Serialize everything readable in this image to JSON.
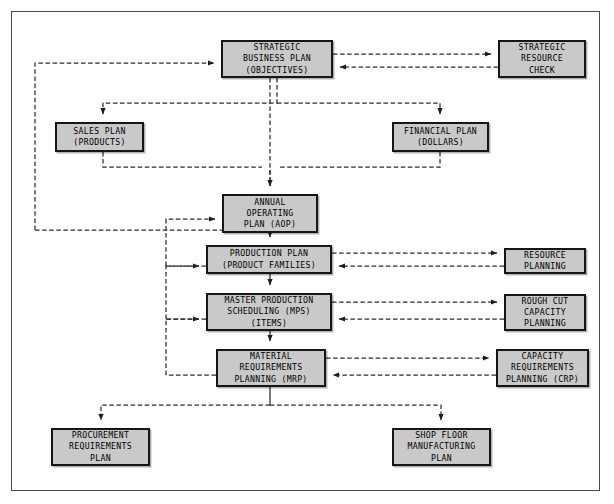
{
  "diagram": {
    "type": "flowchart",
    "box_fill": "#c9c9c9",
    "box_border": "#161616",
    "line_color": "#2b2b2b",
    "frame_color": "#4a4a4a",
    "background": "#ffffff"
  },
  "nodes": {
    "strategic_business_plan": {
      "label": "STRATEGIC\nBUSINESS PLAN\n(OBJECTIVES)",
      "x": 221,
      "y": 40,
      "w": 112,
      "h": 38
    },
    "strategic_resource_check": {
      "label": "STRATEGIC\nRESOURCE\nCHECK",
      "x": 498,
      "y": 40,
      "w": 88,
      "h": 38
    },
    "sales_plan": {
      "label": "SALES PLAN\n(PRODUCTS)",
      "x": 55,
      "y": 122,
      "w": 89,
      "h": 30
    },
    "financial_plan": {
      "label": "FINANCIAL PLAN\n(DOLLARS)",
      "x": 392,
      "y": 122,
      "w": 97,
      "h": 30
    },
    "annual_operating_plan": {
      "label": "ANNUAL\nOPERATING\nPLAN (AOP)",
      "x": 222,
      "y": 194,
      "w": 96,
      "h": 39
    },
    "production_plan": {
      "label": "PRODUCTION PLAN\n(PRODUCT FAMILIES)",
      "x": 206,
      "y": 245,
      "w": 126,
      "h": 29
    },
    "resource_planning": {
      "label": "RESOURCE\nPLANNING",
      "x": 504,
      "y": 248,
      "w": 82,
      "h": 26
    },
    "master_production_scheduling": {
      "label": "MASTER PRODUCTION\nSCHEDULING (MPS)\n(ITEMS)",
      "x": 206,
      "y": 293,
      "w": 126,
      "h": 38
    },
    "rough_cut_capacity_planning": {
      "label": "ROUGH CUT\nCAPACITY\nPLANNING",
      "x": 504,
      "y": 294,
      "w": 82,
      "h": 37
    },
    "material_requirements_planning": {
      "label": "MATERIAL\nREQUIREMENTS\nPLANNING (MRP)",
      "x": 216,
      "y": 349,
      "w": 110,
      "h": 38
    },
    "capacity_requirements_planning": {
      "label": "CAPACITY\nREQUIREMENTS\nPLANNING (CRP)",
      "x": 496,
      "y": 349,
      "w": 93,
      "h": 38
    },
    "procurement_requirements_plan": {
      "label": "PROCUREMENT\nREQUIREMENTS\nPLAN",
      "x": 51,
      "y": 428,
      "w": 99,
      "h": 38
    },
    "shop_floor_manufacturing_plan": {
      "label": "SHOP FLOOR\nMANUFACTURING\nPLAN",
      "x": 392,
      "y": 428,
      "w": 99,
      "h": 38
    }
  },
  "connections": [
    {
      "from": "strategic_business_plan",
      "to": "strategic_resource_check",
      "style": "dashed",
      "arrow": "both"
    },
    {
      "from": "strategic_business_plan",
      "to": "sales_plan",
      "style": "dashed",
      "arrow": "forward"
    },
    {
      "from": "strategic_business_plan",
      "to": "financial_plan",
      "style": "dashed",
      "arrow": "forward"
    },
    {
      "from": "sales_plan",
      "to": "annual_operating_plan",
      "style": "dashed",
      "arrow": "forward"
    },
    {
      "from": "financial_plan",
      "to": "annual_operating_plan",
      "style": "dashed",
      "arrow": "forward"
    },
    {
      "from": "sales_plan",
      "to": "strategic_business_plan",
      "style": "dashed",
      "arrow": "forward"
    },
    {
      "from": "strategic_business_plan",
      "to": "annual_operating_plan",
      "style": "dashed",
      "arrow": "forward"
    },
    {
      "from": "annual_operating_plan",
      "to": "production_plan",
      "style": "solid",
      "arrow": "forward"
    },
    {
      "from": "production_plan",
      "to": "resource_planning",
      "style": "dashed",
      "arrow": "both"
    },
    {
      "from": "production_plan",
      "to": "master_production_scheduling",
      "style": "solid",
      "arrow": "forward"
    },
    {
      "from": "master_production_scheduling",
      "to": "rough_cut_capacity_planning",
      "style": "dashed",
      "arrow": "both"
    },
    {
      "from": "master_production_scheduling",
      "to": "material_requirements_planning",
      "style": "solid",
      "arrow": "forward"
    },
    {
      "from": "material_requirements_planning",
      "to": "capacity_requirements_planning",
      "style": "dashed",
      "arrow": "both"
    },
    {
      "from": "production_plan",
      "to": "annual_operating_plan",
      "style": "dashed",
      "arrow": "forward"
    },
    {
      "from": "master_production_scheduling",
      "to": "production_plan",
      "style": "dashed",
      "arrow": "forward"
    },
    {
      "from": "material_requirements_planning",
      "to": "master_production_scheduling",
      "style": "dashed",
      "arrow": "forward"
    },
    {
      "from": "material_requirements_planning",
      "to": "procurement_requirements_plan",
      "style": "dashed",
      "arrow": "forward"
    },
    {
      "from": "material_requirements_planning",
      "to": "shop_floor_manufacturing_plan",
      "style": "dashed",
      "arrow": "forward"
    }
  ]
}
